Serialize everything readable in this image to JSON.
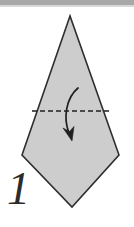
{
  "figure": {
    "step_label": "1",
    "colors": {
      "paper_fill": "#cdcdcd",
      "paper_outline": "#2e2e2e",
      "fold_line": "#1f1f1f",
      "arrow": "#1f1f1f",
      "top_rule": "#a8a8a8",
      "background": "#ffffff",
      "step_number": "#2b2b2b"
    },
    "shape": {
      "name": "kite",
      "points": "70,16 22,155 72,207 119,155",
      "description": "Kite shaped paper with tall pointed apex at top"
    },
    "fold_line": {
      "name": "valley-fold-line",
      "style": "dashed",
      "x1": 32,
      "y1": 111,
      "x2": 110,
      "y2": 111,
      "dash_pattern": "5 3"
    },
    "arrow": {
      "name": "fold-down-arrow",
      "path": "M 78 88 C 66 98 63 118 70 135",
      "head_tip_x": 72,
      "head_tip_y": 141,
      "direction": "down",
      "meaning": "Fold top point down along dashed line"
    }
  }
}
